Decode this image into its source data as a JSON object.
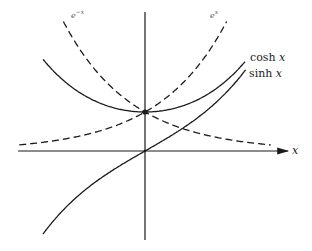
{
  "diagram": {
    "axis": {
      "x_label": "x"
    },
    "curves": [
      {
        "id": "cosh",
        "label_fn": "cosh",
        "label_var": "x",
        "style": "solid"
      },
      {
        "id": "sinh",
        "label_fn": "sinh",
        "label_var": "x",
        "style": "solid"
      },
      {
        "id": "exp_pos",
        "label": "e",
        "label_sup": "x",
        "style": "dashed"
      },
      {
        "id": "exp_neg",
        "label": "e",
        "label_sup": "−x",
        "style": "dashed"
      }
    ],
    "colors": {
      "stroke": "#1a1a1a",
      "background": "#ffffff"
    }
  }
}
